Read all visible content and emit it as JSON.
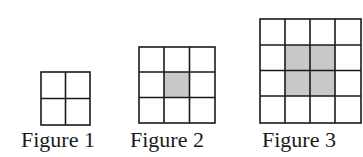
{
  "figures": [
    {
      "label": "Figure 1",
      "size": 2,
      "shaded": []
    },
    {
      "label": "Figure 2",
      "size": 3,
      "shaded": [
        [
          1,
          1
        ]
      ]
    },
    {
      "label": "Figure 3",
      "size": 4,
      "shaded": [
        [
          1,
          1
        ],
        [
          1,
          2
        ],
        [
          2,
          1
        ],
        [
          2,
          2
        ]
      ]
    }
  ],
  "colors": {
    "line": "#1a1a1a",
    "shade": "#c8c8c8",
    "background": "#ffffff"
  }
}
